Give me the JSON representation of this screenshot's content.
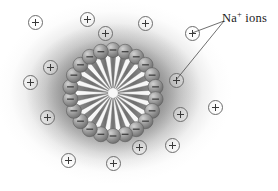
{
  "figure": {
    "background_color": "#ffffff",
    "halo_color": "#6e6e6e"
  },
  "callout": {
    "label_text": "Na",
    "label_superscript": "+",
    "label_suffix": " ions",
    "full_text": "Na+ ions",
    "text_color": "#1b1b1b",
    "leader_origin": {
      "x": 224,
      "y": 21
    },
    "leader_targets": [
      {
        "x": 192,
        "y": 33
      },
      {
        "x": 176,
        "y": 80
      }
    ]
  },
  "micelle": {
    "center": {
      "x": 113,
      "y": 93
    },
    "head_radius": 43,
    "head_group_count": 22,
    "head_group_charge": "–",
    "head_fill_color": "#8e8e8e",
    "tail_color": "#7c7c7c",
    "core_color": "#f7f7f7",
    "head_sphere_diameter": 15,
    "tail_inner_radius": 5,
    "tail_outer_radius": 40
  },
  "sodium_ions": {
    "count": 15,
    "symbol": "+",
    "ring_color": "#6d6d6d",
    "glyph_color": "#3a3a3a",
    "diameter": 15,
    "positions": [
      {
        "x": 35,
        "y": 22
      },
      {
        "x": 87,
        "y": 19
      },
      {
        "x": 105,
        "y": 33
      },
      {
        "x": 145,
        "y": 23
      },
      {
        "x": 192,
        "y": 33
      },
      {
        "x": 50,
        "y": 67
      },
      {
        "x": 30,
        "y": 82
      },
      {
        "x": 176,
        "y": 80
      },
      {
        "x": 215,
        "y": 107
      },
      {
        "x": 180,
        "y": 114
      },
      {
        "x": 47,
        "y": 117
      },
      {
        "x": 68,
        "y": 160
      },
      {
        "x": 113,
        "y": 163
      },
      {
        "x": 139,
        "y": 147
      },
      {
        "x": 172,
        "y": 145
      }
    ]
  }
}
